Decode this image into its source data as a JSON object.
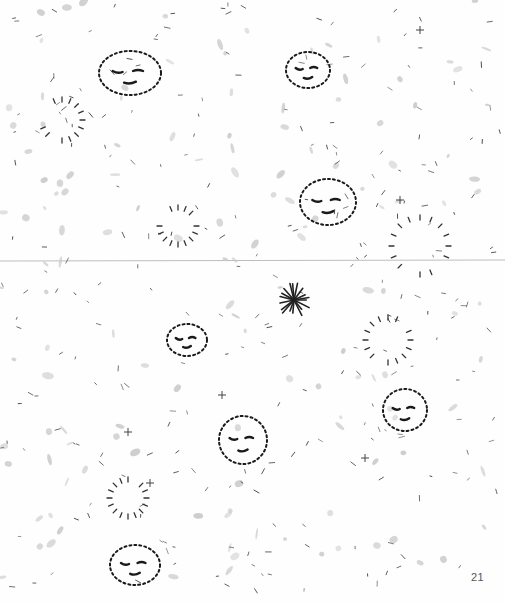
{
  "page": {
    "page_number": "21",
    "colors": {
      "ink": "#1a1a1a",
      "smudge": "#c8c8c8",
      "fold_line": "#bdbdbd",
      "paper": "#fefefe"
    }
  },
  "illustration": {
    "description": "Scattered dotted-outline faces with closed eyes, ray circles, small marks and one dark starburst",
    "faces": [
      {
        "cx": 130,
        "cy": 73,
        "w": 62,
        "h": 44
      },
      {
        "cx": 308,
        "cy": 70,
        "w": 44,
        "h": 36
      },
      {
        "cx": 328,
        "cy": 202,
        "w": 56,
        "h": 46
      },
      {
        "cx": 187,
        "cy": 340,
        "w": 40,
        "h": 32
      },
      {
        "cx": 243,
        "cy": 440,
        "w": 48,
        "h": 48
      },
      {
        "cx": 405,
        "cy": 410,
        "w": 44,
        "h": 42
      },
      {
        "cx": 135,
        "cy": 565,
        "w": 50,
        "h": 40
      }
    ],
    "ray_circles": [
      {
        "cx": 62,
        "cy": 120,
        "r": 18
      },
      {
        "cx": 178,
        "cy": 226,
        "r": 16
      },
      {
        "cx": 420,
        "cy": 246,
        "r": 26
      },
      {
        "cx": 388,
        "cy": 340,
        "r": 20
      },
      {
        "cx": 128,
        "cy": 498,
        "r": 16
      }
    ],
    "starburst": {
      "cx": 294,
      "cy": 300,
      "r": 16
    }
  }
}
